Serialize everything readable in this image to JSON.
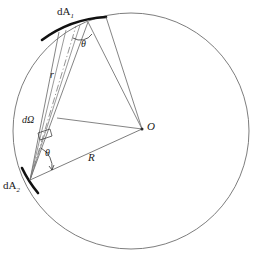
{
  "figure": {
    "type": "geometric-diagram",
    "background_color": "#ffffff",
    "line_color": "#555555",
    "emphasis_color": "#000000",
    "labels": {
      "area_element_1": "dA",
      "area_element_1_sub": "1",
      "area_element_2": "dA",
      "area_element_2_sub": "2",
      "solid_angle": "dΩ",
      "center": "O",
      "sphere_radius": "R",
      "separation_distance": "r",
      "angle_at_dA1": "θ",
      "angle_at_dA2": "θ"
    },
    "geometry": {
      "circle": {
        "cx": 131,
        "cy": 131,
        "r": 118
      },
      "center_point": {
        "x": 142,
        "y": 129
      },
      "dA1_arc": {
        "x1": 43,
        "y1": 38,
        "x2": 105,
        "y2": 18
      },
      "dA2_point": {
        "x": 30,
        "y": 180
      },
      "cone_axis": {
        "from_x": 30,
        "from_y": 180,
        "to_x": 74,
        "to_y": 27
      },
      "chord_dA1_to_O": {
        "x1": 88,
        "y1": 22,
        "x2": 142,
        "y2": 129
      },
      "chord_dA1b_to_O": {
        "x1": 105,
        "y1": 18,
        "x2": 142,
        "y2": 129
      },
      "chord_dA2_to_O": {
        "x1": 30,
        "y1": 180,
        "x2": 142,
        "y2": 129
      },
      "normal_at_dA1": {
        "x1": 57,
        "y1": 118,
        "x2": 142,
        "y2": 129
      }
    }
  }
}
